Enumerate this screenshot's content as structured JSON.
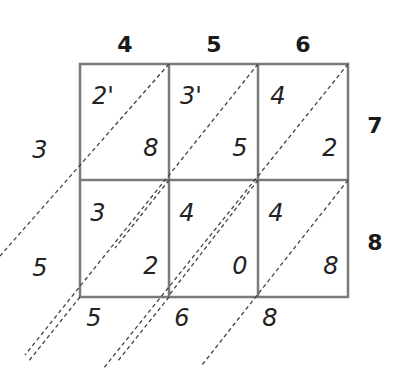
{
  "top_digits": [
    "4",
    "5",
    "6"
  ],
  "right_digits": [
    "7",
    "8"
  ],
  "cells": [
    [
      {
        "tens": "2'",
        "ones": "8"
      },
      {
        "tens": "3'",
        "ones": "5"
      },
      {
        "tens": "4",
        "ones": "2"
      }
    ],
    [
      {
        "tens": "3",
        "ones": "2"
      },
      {
        "tens": "4",
        "ones": "0"
      },
      {
        "tens": "4",
        "ones": "8"
      }
    ]
  ],
  "left_result": [
    "3",
    "5"
  ],
  "bottom_result": [
    "5",
    "6",
    "8"
  ],
  "colors": {
    "grid": "#777777",
    "dash": "#444444"
  }
}
